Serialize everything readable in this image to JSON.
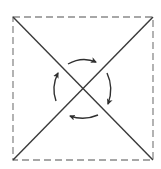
{
  "diagram": {
    "type": "square-with-diagonals-and-rotation",
    "width": 161,
    "height": 169,
    "square": {
      "x1": 13,
      "y1": 17,
      "x2": 153,
      "y2": 160,
      "style": "dashed",
      "stroke": "#8a8a8a",
      "stroke_width": 1.3,
      "dash": "7 4"
    },
    "diagonals": {
      "stroke": "#3a3a3a",
      "stroke_width": 1.4,
      "center": {
        "x": 83,
        "y": 88
      }
    },
    "rotation": {
      "direction": "clockwise",
      "stroke": "#2f2f2f",
      "stroke_width": 1.4,
      "arrows": [
        {
          "name": "top",
          "path": "M 68 64 Q 82 56 96 62",
          "points_to": "right"
        },
        {
          "name": "right",
          "path": "M 107 73 Q 114 88 108 104",
          "points_to": "down"
        },
        {
          "name": "bottom",
          "path": "M 98 115 Q 84 121 70 116",
          "points_to": "left"
        },
        {
          "name": "left",
          "path": "M 56 101 Q 51 87 58 73",
          "points_to": "up"
        }
      ]
    }
  }
}
